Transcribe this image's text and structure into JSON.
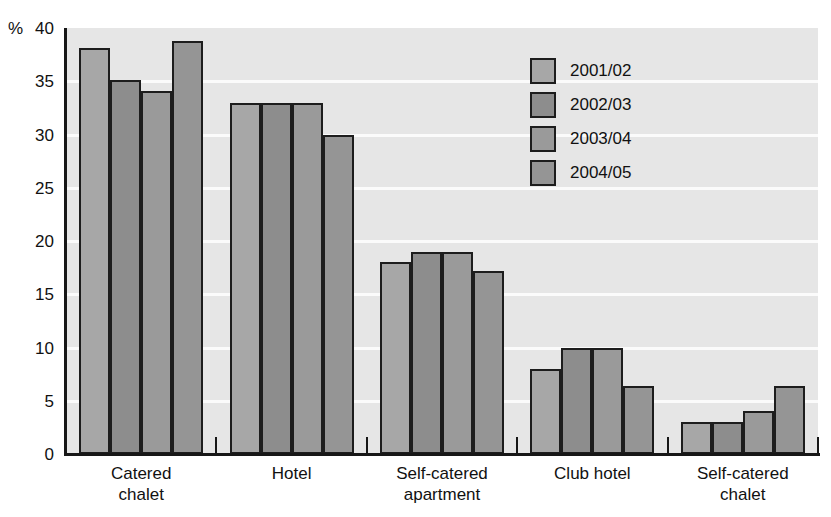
{
  "chart_data": {
    "type": "bar",
    "title": "",
    "xlabel": "",
    "ylabel": "%",
    "ylim": [
      0,
      40
    ],
    "ytick_step": 5,
    "yticks": [
      40,
      35,
      30,
      25,
      20,
      15,
      10,
      5,
      0
    ],
    "ytick_labels": [
      "40",
      "35",
      "30",
      "25",
      "20",
      "15",
      "10",
      "5",
      "0"
    ],
    "grid": true,
    "grid_axis": "y",
    "legend_position": "upper-right-inside",
    "categories": [
      "Catered\nchalet",
      "Hotel",
      "Self-catered\napartment",
      "Club hotel",
      "Self-catered\nchalet"
    ],
    "series": [
      {
        "name": "2001/02",
        "color": "#a7a7a7",
        "values": [
          38.1,
          33.0,
          18.0,
          8.0,
          3.0
        ]
      },
      {
        "name": "2002/03",
        "color": "#8d8d8d",
        "values": [
          35.1,
          33.0,
          19.0,
          10.0,
          3.0
        ]
      },
      {
        "name": "2003/04",
        "color": "#9a9a9a",
        "values": [
          34.1,
          33.0,
          19.0,
          10.0,
          4.0
        ]
      },
      {
        "name": "2004/05",
        "color": "#959595",
        "values": [
          38.8,
          30.0,
          17.2,
          6.4,
          6.4
        ]
      }
    ]
  },
  "axis": {
    "unit_label": "%"
  },
  "colors": {
    "plot_background": "#e6e6e6",
    "gridline": "#fbfbfb",
    "axis_line": "#171717",
    "bar_outline": "#1d1d1d",
    "page_background": "#ffffff"
  },
  "title_fragment": "."
}
